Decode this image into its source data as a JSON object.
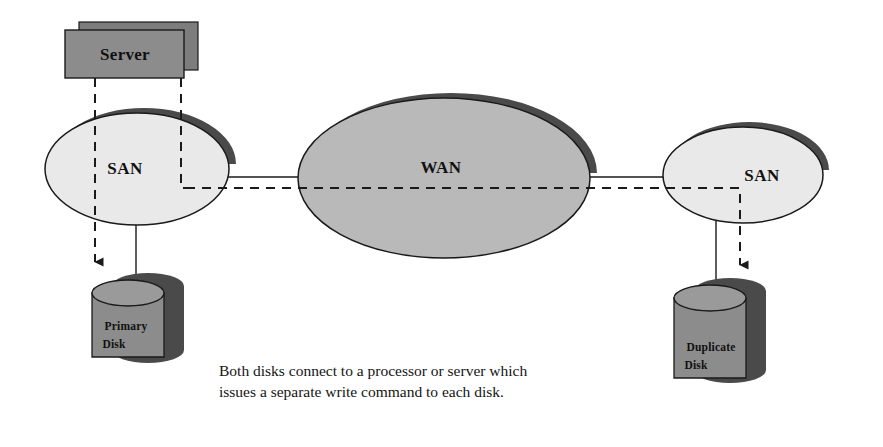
{
  "diagram": {
    "nodes": {
      "server": {
        "label": "Server",
        "shape": "stacked-rectangle"
      },
      "san_left": {
        "label": "SAN",
        "shape": "ellipse"
      },
      "wan": {
        "label": "WAN",
        "shape": "ellipse"
      },
      "san_right": {
        "label": "SAN",
        "shape": "ellipse"
      },
      "primary_disk": {
        "label_line1": "Primary",
        "label_line2": "Disk",
        "shape": "cylinder"
      },
      "duplicate_disk": {
        "label_line1": "Duplicate",
        "label_line2": "Disk",
        "shape": "cylinder"
      }
    },
    "caption": "Both disks connect to a processor or server which issues a separate write command to each disk.",
    "colors": {
      "san_fill": "#e9e9e9",
      "wan_fill": "#b9b9b9",
      "box_fill": "#8c8c8c",
      "disk_fill": "#8c8c8c",
      "shadow": "#4a4a4a",
      "outline": "#1a1a1a",
      "text": "#111111",
      "background": "#ffffff"
    },
    "connectors": [
      {
        "name": "server-to-primary-disk",
        "style": "dashed",
        "arrow": true
      },
      {
        "name": "server-to-remote-path",
        "style": "dashed",
        "arrow": false
      },
      {
        "name": "san-left-to-wan",
        "style": "solid",
        "arrow": false
      },
      {
        "name": "wan-to-san-right",
        "style": "solid",
        "arrow": false
      },
      {
        "name": "replication-path-to-duplicate-disk",
        "style": "dashed",
        "arrow": true
      },
      {
        "name": "san-left-to-primary-disk",
        "style": "solid",
        "arrow": false
      },
      {
        "name": "san-right-to-duplicate-disk",
        "style": "solid",
        "arrow": false
      }
    ]
  }
}
